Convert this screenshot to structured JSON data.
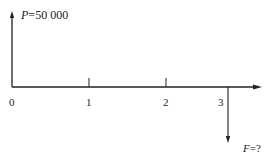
{
  "diagram": {
    "type": "cash-flow",
    "inflow": {
      "symbol": "P",
      "eq": "=",
      "value": "50 000",
      "period": 0,
      "direction": "up"
    },
    "outflow": {
      "symbol": "F",
      "eq": "=?",
      "period": 3,
      "direction": "down"
    },
    "axis_ticks": [
      "0",
      "1",
      "2",
      "3"
    ],
    "line_color": "#222222"
  }
}
